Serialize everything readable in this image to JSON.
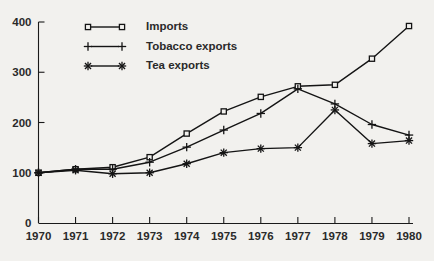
{
  "chart_data": {
    "type": "line",
    "title": "",
    "subtitle": "",
    "xlabel": "",
    "ylabel": "",
    "x": [
      1970,
      1971,
      1972,
      1973,
      1974,
      1975,
      1976,
      1977,
      1978,
      1979,
      1980
    ],
    "xtick_labels": [
      "1970",
      "1971",
      "1972",
      "1973",
      "1974",
      "1975",
      "1976",
      "1977",
      "1978",
      "1979",
      "1980"
    ],
    "ytick_labels": [
      "0",
      "100",
      "200",
      "300",
      "400"
    ],
    "yticks": [
      0,
      100,
      200,
      300,
      400
    ],
    "ylim": [
      0,
      412
    ],
    "xlim": [
      1970,
      1980
    ],
    "grid": false,
    "legend_position": "top-left",
    "series": [
      {
        "name": "Imports",
        "marker": "square",
        "values": [
          100,
          107,
          111,
          131,
          178,
          222,
          251,
          272,
          275,
          327,
          392
        ]
      },
      {
        "name": "Tobacco exports",
        "marker": "plus",
        "values": [
          100,
          107,
          107,
          121,
          151,
          185,
          218,
          267,
          237,
          196,
          175
        ]
      },
      {
        "name": "Tea exports",
        "marker": "asterisk",
        "values": [
          100,
          105,
          98,
          100,
          118,
          140,
          148,
          150,
          225,
          158,
          164
        ]
      }
    ],
    "legend": [
      {
        "label": "Imports",
        "marker": "square"
      },
      {
        "label": "Tobacco exports",
        "marker": "plus"
      },
      {
        "label": "Tea exports",
        "marker": "asterisk"
      }
    ],
    "colors": {
      "ink": "#141414",
      "background": "#f2f1ee",
      "marker_fill": "#f2f1ee"
    }
  }
}
